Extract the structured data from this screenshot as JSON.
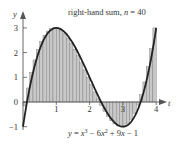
{
  "chart_data": {
    "type": "bar",
    "subtype": "riemann-right-hand-sum-with-curve",
    "title": "right-hand sum, n = 40",
    "title_parts": {
      "prefix": "right-hand sum, ",
      "var": "n",
      "suffix": " = 40"
    },
    "function_label": "y = x³ − 6x² + 9x − 1",
    "function_label_parts": [
      "y",
      " = ",
      "x",
      "3",
      " − 6",
      "x",
      "2",
      " + 9",
      "x",
      " − 1"
    ],
    "xlabel": "t",
    "ylabel": "y",
    "xlim": [
      0,
      4
    ],
    "ylim": [
      -1,
      3
    ],
    "n": 40,
    "x_ticks": [
      "1",
      "2",
      "3",
      "4"
    ],
    "y_ticks": [
      "-1",
      "0",
      "1",
      "2",
      "3"
    ],
    "x_tick_values": [
      1,
      2,
      3,
      4
    ],
    "y_tick_values": [
      -1,
      0,
      1,
      2,
      3
    ],
    "grid": false,
    "legend": "none",
    "curve": {
      "expression": "x^3 - 6x^2 + 9x - 1",
      "coefficients": [
        1,
        -6,
        9,
        -1
      ],
      "domain": [
        0,
        4
      ]
    },
    "colors": {
      "bars_fill": "#c8c8c8",
      "bars_stroke": "#777777",
      "curve": "#222222",
      "axis": "#555555",
      "text": "#333333"
    }
  }
}
